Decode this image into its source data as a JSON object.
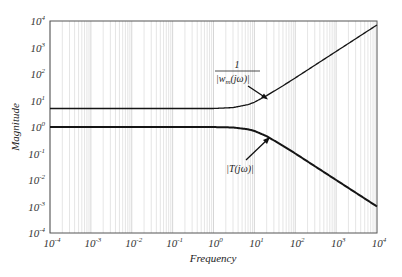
{
  "chart_data": {
    "type": "line",
    "title": "",
    "xlabel": "Frequency",
    "ylabel": "Magnitude",
    "xscale": "log",
    "yscale": "log",
    "xlim": [
      0.0001,
      10000
    ],
    "ylim": [
      0.0001,
      10000
    ],
    "grid": "vertical log gridlines",
    "x_tick_labels": [
      "10^-4",
      "10^-3",
      "10^-2",
      "10^-1",
      "10^0",
      "10^1",
      "10^2",
      "10^3",
      "10^4"
    ],
    "y_tick_labels": [
      "10^-4",
      "10^-3",
      "10^-2",
      "10^-1",
      "10^0",
      "10^1",
      "10^2",
      "10^3",
      "10^4"
    ],
    "series": [
      {
        "name": "1/|w_m(jω)|",
        "annotation": "1 / |w_m(jω)|",
        "x": [
          0.0001,
          0.001,
          0.01,
          0.1,
          1,
          3,
          7,
          10,
          20,
          50,
          100,
          1000,
          10000
        ],
        "values": [
          5,
          5,
          5,
          5,
          5,
          5.4,
          7,
          8.6,
          15.3,
          36,
          71,
          710,
          7100
        ],
        "color": "#222222"
      },
      {
        "name": "|T(jω)|",
        "annotation": "|T(jω)|",
        "x": [
          0.0001,
          0.001,
          0.01,
          0.1,
          1,
          3,
          7,
          10,
          20,
          50,
          100,
          1000,
          10000
        ],
        "values": [
          1,
          1,
          1,
          1,
          0.995,
          0.96,
          0.82,
          0.71,
          0.45,
          0.196,
          0.1,
          0.01,
          0.001
        ],
        "color": "#111111"
      }
    ]
  },
  "labels": {
    "ylabel": "Magnitude",
    "xlabel": "Frequency",
    "wm_numerator": "1",
    "wm_denominator": "|w",
    "wm_sub": "m",
    "wm_tail": "(jω)|",
    "t_label": "|T(jω)|"
  },
  "x_ticks": [
    {
      "base": "10",
      "exp": "-4"
    },
    {
      "base": "10",
      "exp": "-3"
    },
    {
      "base": "10",
      "exp": "-2"
    },
    {
      "base": "10",
      "exp": "-1"
    },
    {
      "base": "10",
      "exp": "0"
    },
    {
      "base": "10",
      "exp": "1"
    },
    {
      "base": "10",
      "exp": "2"
    },
    {
      "base": "10",
      "exp": "3"
    },
    {
      "base": "10",
      "exp": "4"
    }
  ],
  "y_ticks": [
    {
      "base": "10",
      "exp": "4"
    },
    {
      "base": "10",
      "exp": "3"
    },
    {
      "base": "10",
      "exp": "2"
    },
    {
      "base": "10",
      "exp": "1"
    },
    {
      "base": "10",
      "exp": "0"
    },
    {
      "base": "10",
      "exp": "-1"
    },
    {
      "base": "10",
      "exp": "-2"
    },
    {
      "base": "10",
      "exp": "-3"
    },
    {
      "base": "10",
      "exp": "-4"
    }
  ]
}
